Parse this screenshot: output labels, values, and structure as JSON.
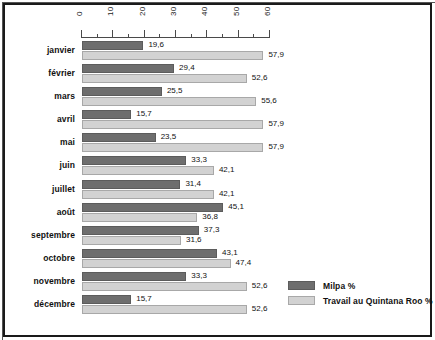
{
  "chart_data": {
    "type": "bar",
    "orientation": "horizontal",
    "title": "",
    "xlabel": "",
    "ylabel": "",
    "xlim": [
      0,
      60
    ],
    "grid": false,
    "legend_position": "bottom-right",
    "axis_ticks": [
      0,
      10,
      20,
      30,
      40,
      50,
      60
    ],
    "axis_minor_step": 5,
    "decimal_separator": ",",
    "categories": [
      "janvier",
      "février",
      "mars",
      "avril",
      "mai",
      "juin",
      "juillet",
      "août",
      "septembre",
      "octobre",
      "novembre",
      "décembre"
    ],
    "series": [
      {
        "name": "Milpa %",
        "color": "#6e6e6e",
        "values": [
          19.6,
          29.4,
          25.5,
          15.7,
          23.5,
          33.3,
          31.4,
          45.1,
          37.3,
          43.1,
          33.3,
          15.7
        ],
        "labels": [
          "19,6",
          "29,4",
          "25,5",
          "15,7",
          "23,5",
          "33,3",
          "31,4",
          "45,1",
          "37,3",
          "43,1",
          "33,3",
          "15,7"
        ]
      },
      {
        "name": "Travail au Quintana Roo %",
        "color": "#d2d2d2",
        "values": [
          57.9,
          52.6,
          55.6,
          57.9,
          57.9,
          42.1,
          42.1,
          36.8,
          31.6,
          47.4,
          52.6,
          52.6
        ],
        "labels": [
          "57,9",
          "52,6",
          "55,6",
          "57,9",
          "57,9",
          "42,1",
          "42,1",
          "36,8",
          "31,6",
          "47,4",
          "52,6",
          "52,6"
        ]
      }
    ]
  },
  "legend": {
    "items": [
      {
        "label": "Milpa %",
        "color": "#6e6e6e"
      },
      {
        "label": "Travail au Quintana Roo %",
        "color": "#d2d2d2"
      }
    ]
  }
}
